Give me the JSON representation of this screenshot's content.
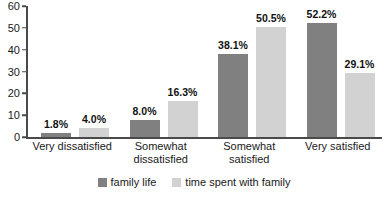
{
  "chart_data": {
    "type": "bar",
    "title": "",
    "subtitle": "",
    "xlabel": "",
    "ylabel": "",
    "ylim": [
      0,
      60
    ],
    "yticks": [
      0,
      10,
      20,
      30,
      40,
      50,
      60
    ],
    "grid": false,
    "legend_position": "bottom-center",
    "categories": [
      "Very dissatisfied",
      "Somewhat dissatisfied",
      "Somewhat satisfied",
      "Very satisfied"
    ],
    "category_lines": [
      [
        "Very dissatisfied"
      ],
      [
        "Somewhat",
        "dissatisfied"
      ],
      [
        "Somewhat",
        "satisfied"
      ],
      [
        "Very satisfied"
      ]
    ],
    "series": [
      {
        "name": "family life",
        "color": "#808080",
        "values": [
          1.8,
          8.0,
          38.1,
          52.2
        ],
        "labels": [
          "1.8%",
          "8.0%",
          "38.1%",
          "52.2%"
        ]
      },
      {
        "name": "time spent with family",
        "color": "#d2d2d2",
        "values": [
          4.0,
          16.3,
          50.5,
          29.1
        ],
        "labels": [
          "4.0%",
          "16.3%",
          "50.5%",
          "29.1%"
        ]
      }
    ],
    "axis_color": "#4a4a4a"
  }
}
